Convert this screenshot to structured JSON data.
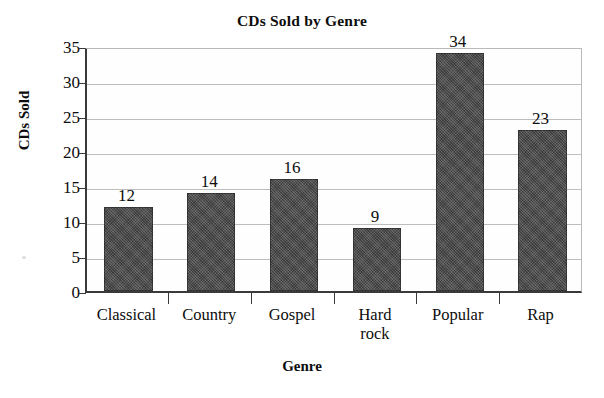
{
  "chart_data": {
    "type": "bar",
    "title": "CDs Sold by Genre",
    "xlabel": "Genre",
    "ylabel": "CDs Sold",
    "categories": [
      "Classical",
      "Country",
      "Gospel",
      "Hard rock",
      "Popular",
      "Rap"
    ],
    "category_lines": [
      [
        "Classical"
      ],
      [
        "Country"
      ],
      [
        "Gospel"
      ],
      [
        "Hard",
        "rock"
      ],
      [
        "Popular"
      ],
      [
        "Rap"
      ]
    ],
    "values": [
      12,
      14,
      16,
      9,
      34,
      23
    ],
    "value_labels": [
      "12",
      "14",
      "16",
      "9",
      "34",
      "23"
    ],
    "ylim": [
      0,
      35
    ],
    "ytick_step": 5,
    "yticks": [
      0,
      5,
      10,
      15,
      20,
      25,
      30,
      35
    ],
    "ytick_labels": [
      "0",
      "5",
      "10",
      "15",
      "20",
      "25",
      "30",
      "35"
    ],
    "grid": true,
    "grid_axis": "y",
    "legend": false,
    "bar_color": "#4a4a4a",
    "grid_color": "#bdbdbd",
    "axis_color": "#3a3a3a",
    "background_color": "#ffffff",
    "data_labels_shown": true
  }
}
